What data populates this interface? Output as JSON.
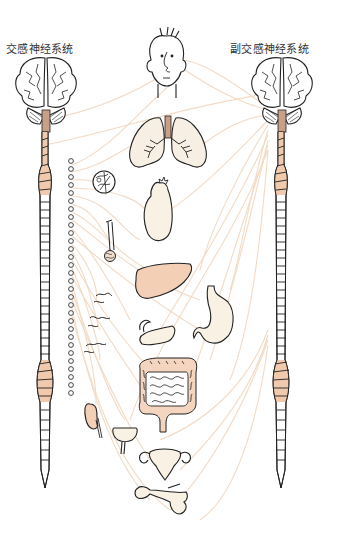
{
  "labels": {
    "sympathetic": "交感神经系统",
    "parasympathetic": "副交感神经系统"
  },
  "colors": {
    "outline": "#222222",
    "nerve": "#f2d9c2",
    "organ_peach": "#f3cfb6",
    "organ_cream": "#f8f1e4",
    "spinal_peach": "#f1c9ac",
    "background": "#ffffff"
  },
  "organs": [
    {
      "id": "head",
      "name": "头部"
    },
    {
      "id": "lungs",
      "name": "肺"
    },
    {
      "id": "eye-detail",
      "name": "眼/腺体"
    },
    {
      "id": "heart",
      "name": "心脏"
    },
    {
      "id": "salivary-gland",
      "name": "唾液腺"
    },
    {
      "id": "liver",
      "name": "肝脏"
    },
    {
      "id": "stomach",
      "name": "胃"
    },
    {
      "id": "pancreas",
      "name": "胰腺"
    },
    {
      "id": "blood-vessels",
      "name": "血管"
    },
    {
      "id": "intestines",
      "name": "肠"
    },
    {
      "id": "kidney",
      "name": "肾脏"
    },
    {
      "id": "bladder",
      "name": "膀胱"
    },
    {
      "id": "uterus",
      "name": "子宫"
    },
    {
      "id": "penis",
      "name": "生殖器"
    }
  ],
  "ganglion_chain": {
    "count": 24
  }
}
